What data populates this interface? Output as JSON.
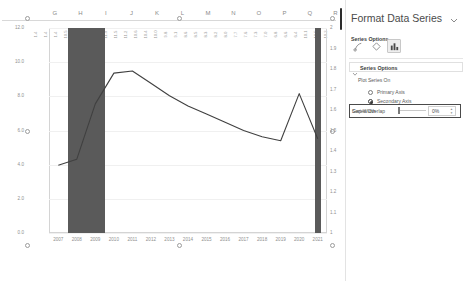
{
  "spreadsheet": {
    "column_headers": [
      "G",
      "H",
      "I",
      "J",
      "K",
      "L",
      "M",
      "N",
      "O",
      "P",
      "Q",
      "R"
    ],
    "data_row_values": [
      "1.4",
      "1.4",
      "1.4",
      "10.5",
      "10.0",
      "11.3",
      "11.7",
      "11.9",
      "11.5",
      "11.2",
      "10.6",
      "10.4",
      "10.0",
      "9.8",
      "9.1",
      "8.6",
      "8.5",
      "8.3",
      "8.2",
      "8.0",
      "7.7",
      "7.6",
      "7.3",
      "7.0",
      "6.8",
      "6.6",
      "6.4",
      "10.1",
      "10.5",
      "10.2"
    ]
  },
  "chart_data": {
    "type": "bar",
    "title": "",
    "xlabel": "",
    "ylabel": "",
    "categories": [
      "2007",
      "2008",
      "2009",
      "2010",
      "2011",
      "2012",
      "2013",
      "2014",
      "2015",
      "2016",
      "2017",
      "2018",
      "2019",
      "2020",
      "2021"
    ],
    "series": [
      {
        "name": "Bars (primary axis)",
        "type": "bar",
        "axis": "primary",
        "color": "#5a5a5a",
        "values": [
          0,
          12.0,
          12.0,
          0,
          0,
          0,
          0,
          0,
          0,
          0,
          0,
          0,
          0,
          0,
          12.0
        ]
      },
      {
        "name": "Line (secondary axis)",
        "type": "line",
        "axis": "secondary",
        "color": "#404040",
        "values": [
          1.33,
          1.36,
          1.63,
          1.78,
          1.79,
          1.73,
          1.67,
          1.62,
          1.58,
          1.54,
          1.5,
          1.47,
          1.45,
          1.68,
          1.46
        ]
      }
    ],
    "primary_axis": {
      "position": "left",
      "ticks": [
        "0.0",
        "2.0",
        "4.0",
        "6.0",
        "8.0",
        "10.0",
        "12.0"
      ],
      "ylim": [
        0,
        12
      ]
    },
    "secondary_axis": {
      "position": "right",
      "ticks": [
        "1",
        "1.1",
        "1.2",
        "1.3",
        "1.4",
        "1.5",
        "1.6",
        "1.7",
        "1.8",
        "1.9",
        "2"
      ],
      "ylim": [
        1,
        2
      ]
    },
    "grid": true,
    "legend": "none"
  },
  "pane": {
    "title": "Format Data Series",
    "collapse_icon": "chevron-down-icon",
    "series_options_dropdown": {
      "label": "Series Options",
      "caret_icon": "chevron-down-icon"
    },
    "icon_tabs": [
      {
        "name": "fill-line-icon",
        "glyph": "⬚",
        "selected": false
      },
      {
        "name": "effects-icon",
        "glyph": "⬠",
        "selected": false
      },
      {
        "name": "series-options-icon",
        "glyph": "█",
        "selected": true
      }
    ],
    "section": {
      "caret_icon": "chevron-down-icon",
      "title": "Series Options"
    },
    "plot_series_on_label": "Plot Series On",
    "radios": [
      {
        "label": "Primary Axis",
        "selected": false,
        "name": "primary-axis-radio"
      },
      {
        "label": "Secondary Axis",
        "selected": true,
        "name": "secondary-axis-radio"
      }
    ],
    "fields": [
      {
        "label": "Series Overlap",
        "underline": "S",
        "value": "0%",
        "name": "series-overlap",
        "knob_pct": 0,
        "focused": false
      },
      {
        "label": "Gap Width",
        "underline": "W",
        "value": "0%",
        "name": "gap-width",
        "knob_pct": 0,
        "focused": true
      }
    ]
  }
}
